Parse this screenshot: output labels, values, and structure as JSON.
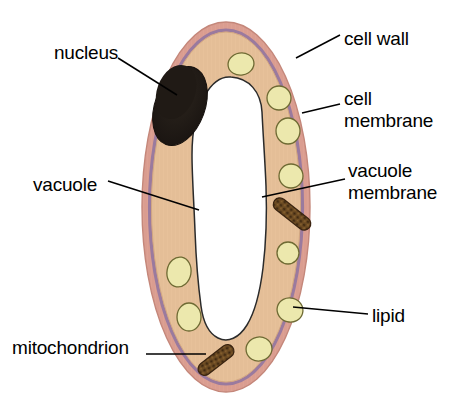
{
  "diagram": {
    "background_color": "#ffffff",
    "colors": {
      "cell_wall": "#dda193",
      "cell_wall_outline": "#c98a7d",
      "cell_membrane": "#9a7a9e",
      "cytoplasm": "#e9c49e",
      "cytoplasm_outline": "#c9a179",
      "vacuole": "#ffffff",
      "vacuole_outline": "#2b2b2b",
      "nucleus": "#231c16",
      "lipid": "#ece8ad",
      "lipid_outline": "#6e6a33",
      "mitochondrion": "#6b4420",
      "mitochondrion_outline": "#3a2410",
      "leader_line": "#000000",
      "label_text": "#000000"
    },
    "labels": [
      {
        "id": "cell-wall",
        "text": "cell wall",
        "lines": [
          "cell wall"
        ],
        "side": "right",
        "x": 344,
        "y": 28
      },
      {
        "id": "cell-membrane",
        "text": "cell membrane",
        "lines": [
          "cell",
          "membrane"
        ],
        "side": "right",
        "x": 344,
        "y": 88
      },
      {
        "id": "vacuole-membrane",
        "text": "vacuole membrane",
        "lines": [
          "vacuole",
          "membrane"
        ],
        "side": "right",
        "x": 348,
        "y": 160
      },
      {
        "id": "lipid",
        "text": "lipid",
        "lines": [
          "lipid"
        ],
        "side": "right",
        "x": 372,
        "y": 305
      },
      {
        "id": "nucleus",
        "text": "nucleus",
        "lines": [
          "nucleus"
        ],
        "side": "left",
        "x": 54,
        "y": 42
      },
      {
        "id": "vacuole",
        "text": "vacuole",
        "lines": [
          "vacuole"
        ],
        "side": "left",
        "x": 33,
        "y": 174
      },
      {
        "id": "mitochondrion",
        "text": "mitochondrion",
        "lines": [
          "mitochondrion"
        ],
        "side": "left",
        "x": 12,
        "y": 337
      }
    ],
    "structures": {
      "cell_wall": {
        "name": "cell wall",
        "cx": 226,
        "cy": 207,
        "rx": 84,
        "ry": 185
      },
      "cell_membrane": {
        "name": "cell membrane",
        "cx": 226,
        "cy": 207,
        "rx": 78,
        "ry": 178
      },
      "cytoplasm": {
        "name": "cytoplasm",
        "cx": 226,
        "cy": 207,
        "rx": 75,
        "ry": 175
      },
      "nucleus": {
        "name": "nucleus",
        "cx": 180,
        "cy": 105,
        "rx": 26,
        "ry": 40,
        "rotation": 22
      },
      "vacuole": {
        "name": "vacuole"
      },
      "lipids": [
        {
          "cx": 241,
          "cy": 64,
          "rx": 13,
          "ry": 11,
          "rotation": -10
        },
        {
          "cx": 279,
          "cy": 98,
          "rx": 12,
          "ry": 12,
          "rotation": 0
        },
        {
          "cx": 288,
          "cy": 131,
          "rx": 12,
          "ry": 13,
          "rotation": 0
        },
        {
          "cx": 291,
          "cy": 176,
          "rx": 12,
          "ry": 12,
          "rotation": 0
        },
        {
          "cx": 288,
          "cy": 253,
          "rx": 11,
          "ry": 11,
          "rotation": 0
        },
        {
          "cx": 290,
          "cy": 310,
          "rx": 13,
          "ry": 12,
          "rotation": 15
        },
        {
          "cx": 179,
          "cy": 272,
          "rx": 12,
          "ry": 15,
          "rotation": 10
        },
        {
          "cx": 189,
          "cy": 317,
          "rx": 12,
          "ry": 14,
          "rotation": 0
        },
        {
          "cx": 259,
          "cy": 349,
          "rx": 13,
          "ry": 12,
          "rotation": -12
        }
      ],
      "mitochondria": [
        {
          "cx": 292,
          "cy": 214,
          "length": 44,
          "thickness": 13,
          "rotation": 38
        },
        {
          "cx": 216,
          "cy": 360,
          "length": 42,
          "thickness": 13,
          "rotation": -38
        }
      ]
    }
  }
}
